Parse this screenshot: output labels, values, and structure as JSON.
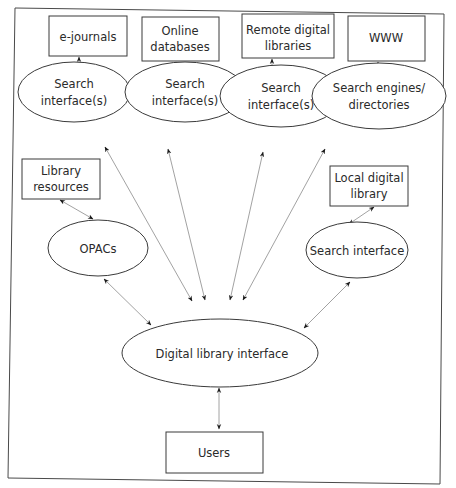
{
  "diagram": {
    "title": "",
    "colors": {
      "stroke": "#3a3a3a",
      "edge": "#8a8a8a",
      "text": "#2a2a2a",
      "background": "#ffffff"
    },
    "sources": [
      {
        "id": "ejournals",
        "line1": "e-journals",
        "line2": ""
      },
      {
        "id": "online-databases",
        "line1": "Online",
        "line2": "databases"
      },
      {
        "id": "remote-digital-libraries",
        "line1": "Remote digital",
        "line2": "libraries"
      },
      {
        "id": "www",
        "line1": "WWW",
        "line2": ""
      },
      {
        "id": "library-resources",
        "line1": "Library",
        "line2": "resources"
      },
      {
        "id": "local-digital-library",
        "line1": "Local digital",
        "line2": "library"
      }
    ],
    "interfaces": [
      {
        "id": "search-interface-1",
        "line1": "Search",
        "line2": "interface(s)"
      },
      {
        "id": "search-interface-2",
        "line1": "Search",
        "line2": "interface(s)"
      },
      {
        "id": "search-interface-3",
        "line1": "Search",
        "line2": "interface(s)"
      },
      {
        "id": "search-engines",
        "line1": "Search engines/",
        "line2": "directories"
      },
      {
        "id": "opacs",
        "line1": "OPACs"
      },
      {
        "id": "search-interface-local",
        "line1": "Search interface"
      }
    ],
    "hub": {
      "label": "Digital library interface"
    },
    "users": {
      "label": "Users"
    },
    "connections": [
      [
        "e-journals",
        "Search interface(s) 1"
      ],
      [
        "Online databases",
        "Search interface(s) 2"
      ],
      [
        "Remote digital libraries",
        "Search interface(s) 3"
      ],
      [
        "WWW",
        "Search engines/directories"
      ],
      [
        "Library resources",
        "OPACs"
      ],
      [
        "Local digital library",
        "Search interface"
      ],
      [
        "Search interface(s) 1",
        "Digital library interface"
      ],
      [
        "Search interface(s) 2",
        "Digital library interface"
      ],
      [
        "Search interface(s) 3",
        "Digital library interface"
      ],
      [
        "Search engines/directories",
        "Digital library interface"
      ],
      [
        "OPACs",
        "Digital library interface"
      ],
      [
        "Search interface",
        "Digital library interface"
      ],
      [
        "Digital library interface",
        "Users"
      ]
    ]
  }
}
